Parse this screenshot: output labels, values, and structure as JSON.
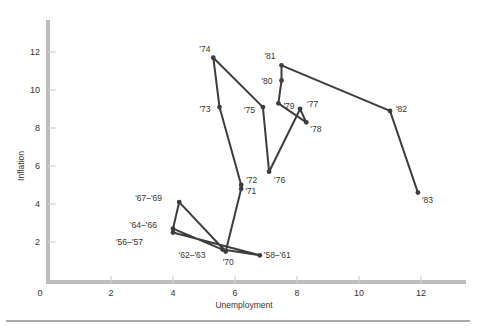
{
  "chart_data": {
    "type": "line",
    "title": "",
    "xlabel": "Unemployment",
    "ylabel": "Inflation",
    "xlim": [
      0,
      13.5
    ],
    "ylim": [
      0,
      13.5
    ],
    "grid": false,
    "x_ticks": [
      0,
      2,
      4,
      6,
      8,
      10,
      12
    ],
    "y_ticks": [
      2,
      4,
      6,
      8,
      10,
      12
    ],
    "x_tick_labels": [
      "0",
      "2",
      "4",
      "6",
      "8",
      "10",
      "12"
    ],
    "y_tick_labels": [
      "2",
      "4",
      "6",
      "8",
      "10",
      "12"
    ],
    "series": [
      {
        "name": "Inflation vs Unemployment",
        "points": [
          {
            "label": "'56–'57",
            "x": 4.0,
            "y": 2.5
          },
          {
            "label": "'58–'61",
            "x": 6.8,
            "y": 1.3
          },
          {
            "label": "'62–'63",
            "x": 5.6,
            "y": 1.6
          },
          {
            "label": "'64–'66",
            "x": 4.0,
            "y": 2.7
          },
          {
            "label": "'67–'69",
            "x": 4.2,
            "y": 4.1
          },
          {
            "label": "'70",
            "x": 5.7,
            "y": 1.5
          },
          {
            "label": "'71",
            "x": 6.2,
            "y": 4.8
          },
          {
            "label": "'72",
            "x": 6.2,
            "y": 5.0
          },
          {
            "label": "'73",
            "x": 5.5,
            "y": 9.1
          },
          {
            "label": "'74",
            "x": 5.3,
            "y": 11.7
          },
          {
            "label": "'75",
            "x": 6.9,
            "y": 9.1
          },
          {
            "label": "'76",
            "x": 7.1,
            "y": 5.7
          },
          {
            "label": "'77",
            "x": 8.1,
            "y": 9.0
          },
          {
            "label": "'78",
            "x": 8.3,
            "y": 8.3
          },
          {
            "label": "'79",
            "x": 7.4,
            "y": 9.3
          },
          {
            "label": "'80",
            "x": 7.5,
            "y": 10.5
          },
          {
            "label": "'81",
            "x": 7.5,
            "y": 11.3
          },
          {
            "label": "'82",
            "x": 11.0,
            "y": 8.9
          },
          {
            "label": "'83",
            "x": 11.9,
            "y": 4.6
          }
        ]
      }
    ]
  },
  "colors": {
    "axis": "#bdbdbd",
    "line": "#3d3d3d",
    "text": "#333333",
    "rule": "#555555"
  }
}
